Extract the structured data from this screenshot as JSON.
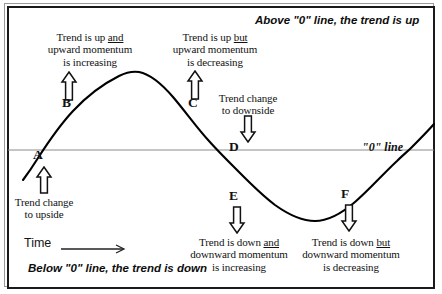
{
  "diagram": {
    "top_caption": "Above \"0\" line, the trend is up",
    "bottom_caption": "Below \"0\" line, the trend is down",
    "zero_line_label": "\"0\" line",
    "time_axis_label": "Time",
    "colors": {
      "curve": "#000000",
      "zero_line": "#8c8c8c",
      "border": "#1a1a1a",
      "text": "#111111",
      "background": "#ffffff"
    },
    "points": [
      {
        "id": "A",
        "label": "A",
        "arrow": "up",
        "note_lines": [
          "Trend change",
          "to upside"
        ],
        "note_position": "below"
      },
      {
        "id": "B",
        "label": "B",
        "arrow": "up",
        "note_lines": [
          "Trend is up and",
          "upward momentum",
          "is increasing"
        ],
        "note_underline_word": "and",
        "note_position": "above"
      },
      {
        "id": "C",
        "label": "C",
        "arrow": "up",
        "note_lines": [
          "Trend is up but",
          "upward momentum",
          "is decreasing"
        ],
        "note_underline_word": "but",
        "note_position": "above"
      },
      {
        "id": "D",
        "label": "D",
        "arrow": "down",
        "note_lines": [
          "Trend change",
          "to downside"
        ],
        "note_position": "above"
      },
      {
        "id": "E",
        "label": "E",
        "arrow": "down",
        "note_lines": [
          "Trend is down and",
          "downward momentum",
          "is increasing"
        ],
        "note_underline_word": "and",
        "note_position": "below"
      },
      {
        "id": "F",
        "label": "F",
        "arrow": "down",
        "note_lines": [
          "Trend is down but",
          "downward momentum",
          "is decreasing"
        ],
        "note_underline_word": "but",
        "note_position": "below"
      }
    ]
  },
  "chart_data": {
    "type": "line",
    "title": "",
    "xlabel": "Time",
    "ylabel": "",
    "grid": false,
    "legend": "none",
    "zero_line_y": 0,
    "x": [
      0,
      10,
      20,
      30,
      38,
      50,
      65,
      80,
      95,
      110,
      128,
      145,
      160,
      175,
      190,
      205,
      218,
      233,
      250,
      265,
      280,
      295,
      315,
      330,
      345,
      360,
      375,
      390,
      403,
      415,
      428
    ],
    "y": [
      -0.38,
      -0.3,
      -0.22,
      -0.1,
      0,
      0.2,
      0.42,
      0.63,
      0.8,
      0.93,
      1.0,
      0.95,
      0.86,
      0.72,
      0.55,
      0.3,
      0.12,
      0.0,
      -0.25,
      -0.48,
      -0.68,
      -0.85,
      -0.97,
      -0.92,
      -0.8,
      -0.63,
      -0.43,
      -0.17,
      0.0,
      0.18,
      0.42
    ],
    "annotations": [
      {
        "label": "A",
        "x": 38,
        "y": 0,
        "text": "Trend change to upside"
      },
      {
        "label": "B",
        "x": 80,
        "y": 0.63,
        "text": "Trend is up and upward momentum is increasing"
      },
      {
        "label": "C",
        "x": 190,
        "y": 0.55,
        "text": "Trend is up but upward momentum is decreasing"
      },
      {
        "label": "D",
        "x": 233,
        "y": 0,
        "text": "Trend change to downside"
      },
      {
        "label": "E",
        "x": 265,
        "y": -0.48,
        "text": "Trend is down and downward momentum is increasing"
      },
      {
        "label": "F",
        "x": 375,
        "y": -0.43,
        "text": "Trend is down but downward momentum is decreasing"
      }
    ]
  }
}
